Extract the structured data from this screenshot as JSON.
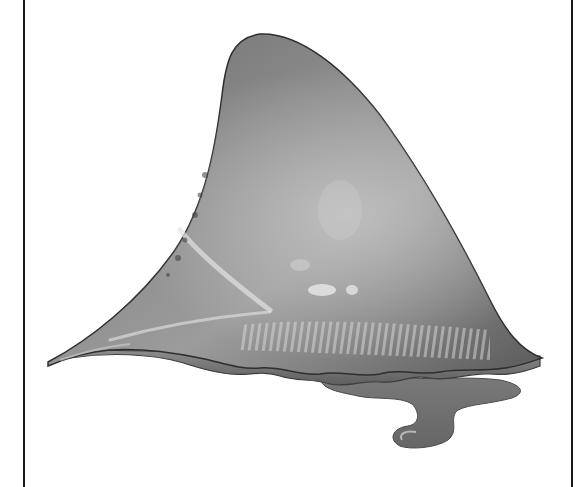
{
  "figure": {
    "alt": "Grayscale illustration of a shark dorsal fin",
    "style": "grayscale",
    "colors": {
      "background": "#ffffff",
      "frame": "#1a1a1a",
      "fin_dark": "#3a3a3a",
      "fin_mid": "#7a7a7a",
      "fin_light": "#b5b5b5",
      "highlight": "#e6e6e6"
    }
  }
}
